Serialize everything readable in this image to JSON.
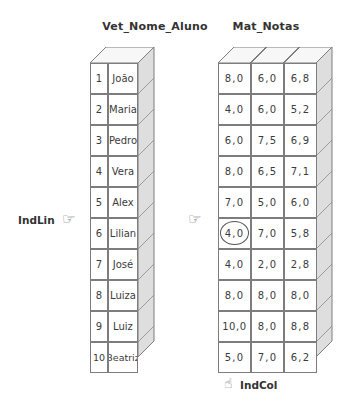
{
  "titles": {
    "vector": "Vet_Nome_Aluno",
    "matrix": "Mat_Notas"
  },
  "vector": {
    "name": "Vet_Nome_Aluno",
    "indices": [
      "1",
      "2",
      "3",
      "4",
      "5",
      "6",
      "7",
      "8",
      "9",
      "10"
    ],
    "values": [
      "João",
      "Maria",
      "Pedro",
      "Vera",
      "Alex",
      "Lilian",
      "José",
      "Luiza",
      "Luiz",
      "Beatriz"
    ]
  },
  "matrix": {
    "name": "Mat_Notas",
    "rows": [
      [
        "8,0",
        "6,0",
        "6,8"
      ],
      [
        "4,0",
        "6,0",
        "5,2"
      ],
      [
        "6,0",
        "7,5",
        "6,9"
      ],
      [
        "8,0",
        "6,5",
        "7,1"
      ],
      [
        "7,0",
        "5,0",
        "6,0"
      ],
      [
        "4,0",
        "7,0",
        "5,8"
      ],
      [
        "4,0",
        "2,0",
        "2,8"
      ],
      [
        "8,0",
        "8,0",
        "8,0"
      ],
      [
        "10,0",
        "8,0",
        "8,8"
      ],
      [
        "5,0",
        "7,0",
        "6,2"
      ]
    ],
    "highlighted_cell": {
      "row": 6,
      "column": 1,
      "value": "4,0"
    }
  },
  "indicators": {
    "row": {
      "label": "IndLin",
      "icon": "pointing-hand-right-icon",
      "glyph": "☞"
    },
    "row_secondary": {
      "icon": "pointing-hand-right-icon",
      "glyph": "☞"
    },
    "column": {
      "label": "IndCol",
      "icon": "pointing-hand-up-icon",
      "glyph": "☝"
    }
  },
  "colors": {
    "background": "#ffffff",
    "line": "#7d7d7d",
    "text": "#3b3b3b",
    "title": "#333333",
    "face_top": "#f2f2f2",
    "face_side": "#d9d9d9",
    "highlight": "#555555"
  }
}
